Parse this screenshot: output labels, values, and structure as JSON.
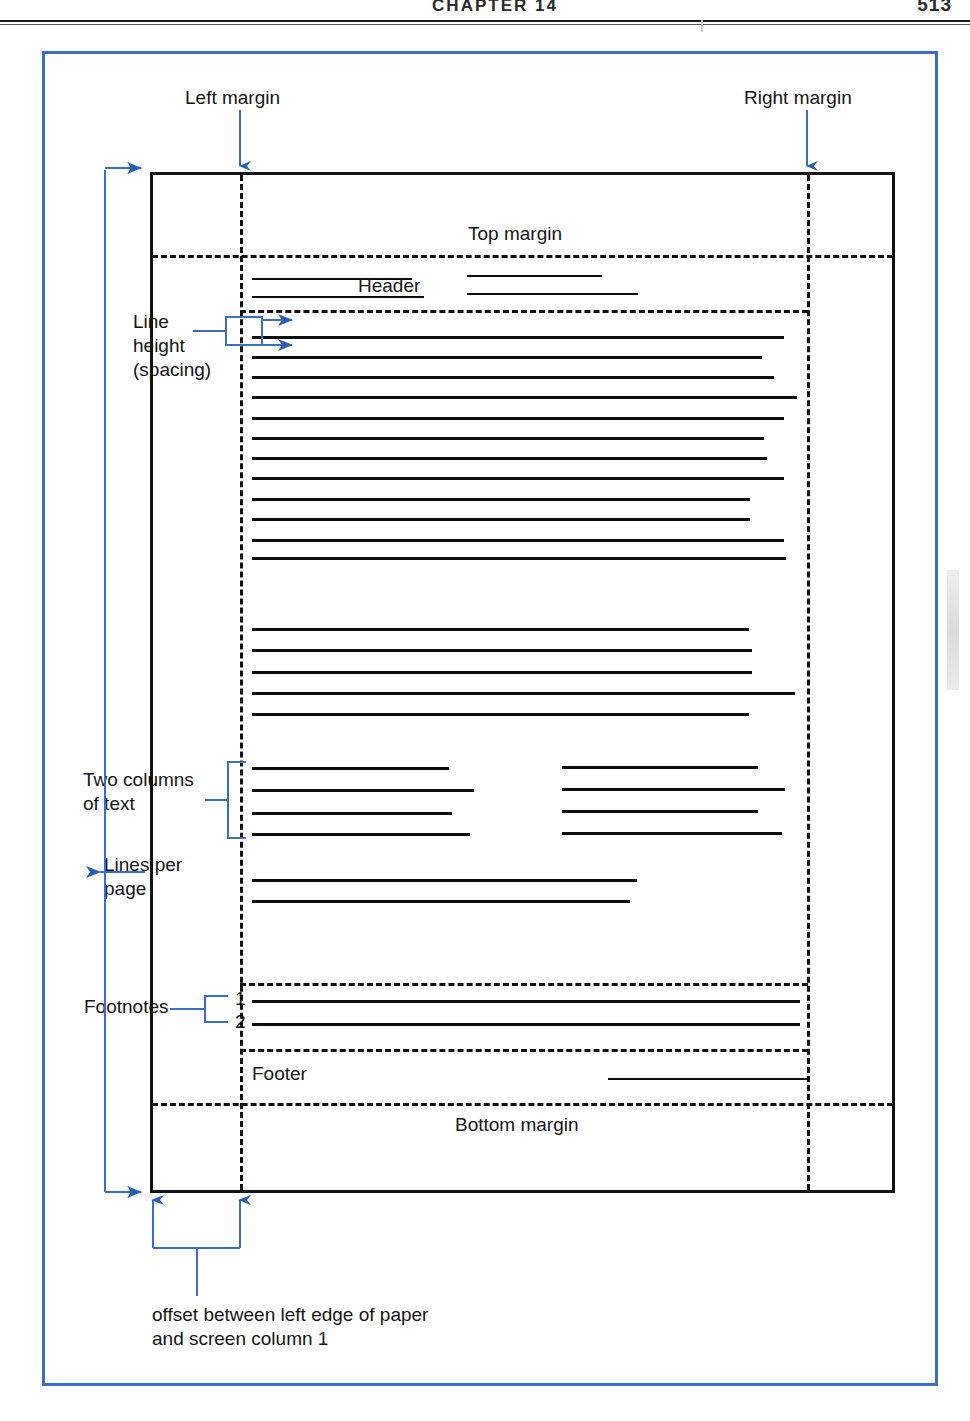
{
  "page": {
    "running_head": "CHAPTER 14",
    "folio": "513"
  },
  "figure": {
    "frame_color": "#3a6fc4",
    "ink_color": "#101010",
    "labels": {
      "left_margin": "Left margin",
      "right_margin": "Right margin",
      "top_margin": "Top margin",
      "bottom_margin": "Bottom margin",
      "header": "Header",
      "footer": "Footer",
      "line_height": "Line\nheight\n(spacing)",
      "two_columns": "Two columns\nof text",
      "lines_per_page": "Lines per\npage",
      "footnotes": "Footnotes",
      "footnote_1": "1",
      "footnote_2": "2",
      "offset_caption": "offset between left edge of paper\nand screen column 1"
    }
  },
  "chart_data": {
    "type": "diagram",
    "regions": [
      {
        "name": "paper-box",
        "x": 150,
        "y": 172,
        "w": 745,
        "h": 1021
      },
      {
        "name": "left-margin-guide",
        "x": 240,
        "orientation": "vertical"
      },
      {
        "name": "right-margin-guide",
        "x": 807,
        "orientation": "vertical"
      },
      {
        "name": "top-margin-guide",
        "y": 255,
        "orientation": "horizontal"
      },
      {
        "name": "header-bottom-guide",
        "y": 310,
        "orientation": "horizontal"
      },
      {
        "name": "footnote-top-guide",
        "y": 983,
        "orientation": "horizontal"
      },
      {
        "name": "footer-top-guide",
        "y": 1049,
        "orientation": "horizontal"
      },
      {
        "name": "bottom-margin-guide",
        "y": 1103,
        "orientation": "horizontal"
      }
    ],
    "header_lines": [
      {
        "x": 252,
        "y": 278,
        "w": 160
      },
      {
        "x": 252,
        "y": 296,
        "w": 172
      },
      {
        "x": 467,
        "y": 275,
        "w": 135
      },
      {
        "x": 467,
        "y": 293,
        "w": 171
      }
    ],
    "body_block_1": [
      {
        "y": 336,
        "w": 532
      },
      {
        "y": 356,
        "w": 510
      },
      {
        "y": 376,
        "w": 522
      },
      {
        "y": 396,
        "w": 545
      },
      {
        "y": 417,
        "w": 532
      },
      {
        "y": 437,
        "w": 512
      },
      {
        "y": 457,
        "w": 515
      },
      {
        "y": 477,
        "w": 532
      },
      {
        "y": 498,
        "w": 498
      },
      {
        "y": 518,
        "w": 498
      },
      {
        "y": 539,
        "w": 532
      },
      {
        "y": 557,
        "w": 534
      }
    ],
    "body_block_2": [
      {
        "y": 628,
        "w": 497
      },
      {
        "y": 649,
        "w": 500
      },
      {
        "y": 671,
        "w": 500
      },
      {
        "y": 692,
        "w": 543
      },
      {
        "y": 713,
        "w": 497
      }
    ],
    "two_column_left": [
      {
        "y": 767,
        "w": 197
      },
      {
        "y": 789,
        "w": 222
      },
      {
        "y": 812,
        "w": 200
      },
      {
        "y": 833,
        "w": 218
      }
    ],
    "two_column_right": [
      {
        "x": 562,
        "y": 766,
        "w": 196
      },
      {
        "x": 562,
        "y": 788,
        "w": 223
      },
      {
        "x": 562,
        "y": 810,
        "w": 196
      },
      {
        "x": 562,
        "y": 832,
        "w": 220
      }
    ],
    "lines_per_page_block": [
      {
        "y": 879,
        "w": 385
      },
      {
        "y": 900,
        "w": 378
      }
    ],
    "footnote_lines": [
      {
        "y": 1000,
        "w": 548
      },
      {
        "y": 1023,
        "w": 548
      }
    ],
    "footer_line": {
      "x": 608,
      "y": 1078,
      "w": 200
    }
  }
}
